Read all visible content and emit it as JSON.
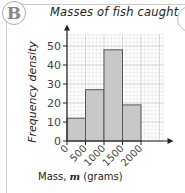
{
  "badge": {
    "label": "B"
  },
  "chart_data": {
    "type": "bar",
    "title": "Masses of fish caught",
    "xlabel": "Mass, m (grams)",
    "ylabel": "Frequency density",
    "categories": [
      "0-500",
      "500-1000",
      "1000-1500",
      "1500-2000"
    ],
    "bin_edges": [
      0,
      500,
      1000,
      1500,
      2000
    ],
    "values": [
      12,
      27,
      48,
      19
    ],
    "x_ticks": [
      "0",
      "500",
      "1000",
      "1500",
      "2000"
    ],
    "y_ticks": [
      "0",
      "10",
      "20",
      "30",
      "40",
      "50"
    ],
    "ylim": [
      0,
      55
    ],
    "xlim": [
      0,
      2500
    ],
    "grid": true,
    "histogram": true,
    "bar_color": "#c8c8c8"
  },
  "xlabel_parts": {
    "pre": "Mass, ",
    "var": "m",
    "post": " (grams)"
  }
}
